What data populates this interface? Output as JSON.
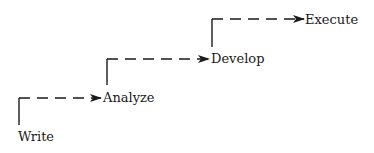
{
  "diagram": {
    "type": "staircase-flow",
    "steps": [
      {
        "label": "Write"
      },
      {
        "label": "Analyze"
      },
      {
        "label": "Develop"
      },
      {
        "label": "Execute"
      }
    ],
    "line_color": "#1a1a1a",
    "connector_style": "dashed-arrow"
  }
}
